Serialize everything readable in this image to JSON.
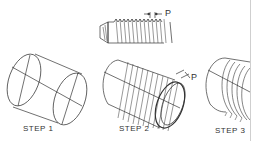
{
  "figure": {
    "steps": [
      {
        "label": "STEP 1"
      },
      {
        "label": "STEP 2"
      },
      {
        "label": "STEP 3"
      }
    ],
    "pitch_label_top": "P",
    "pitch_label_step2": "P"
  },
  "colors": {
    "line": "#333333",
    "background": "#ffffff"
  }
}
